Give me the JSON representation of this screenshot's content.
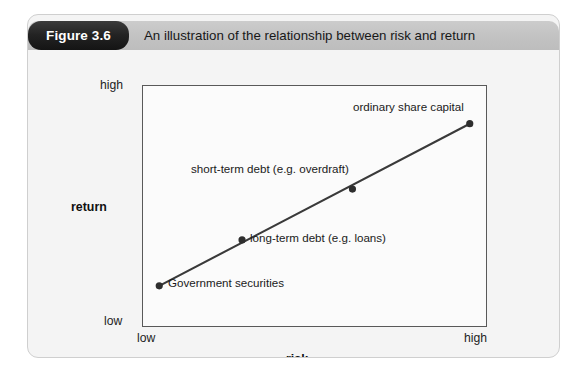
{
  "figure": {
    "badge_label": "Figure 3.6",
    "title": "An illustration of the relationship between risk and return"
  },
  "axes": {
    "y_title": "return",
    "x_title": "risk",
    "y_high": "high",
    "y_low": "low",
    "x_low": "low",
    "x_high": "high"
  },
  "colors": {
    "badge": "#232323",
    "header_band": "#c4c4c4",
    "card_background": "#f4f4f4",
    "plot_border": "#595959",
    "line": "#3a3a3a",
    "point": "#2e2e2e"
  },
  "chart_data": {
    "type": "scatter",
    "title": "An illustration of the relationship between risk and return",
    "xlabel": "risk",
    "ylabel": "return",
    "xlim": [
      0,
      1
    ],
    "ylim": [
      0,
      1
    ],
    "xtick_labels": [
      "low",
      "high"
    ],
    "ytick_labels": [
      "low",
      "high"
    ],
    "grid": false,
    "legend": "none",
    "line_through_points": true,
    "points": [
      {
        "label": "Government securities",
        "x": 0.05,
        "y": 0.17
      },
      {
        "label": "long-term debt (e.g. loans)",
        "x": 0.29,
        "y": 0.36
      },
      {
        "label": "short-term debt (e.g. overdraft)",
        "x": 0.61,
        "y": 0.57
      },
      {
        "label": "ordinary share capital",
        "x": 0.95,
        "y": 0.84
      }
    ]
  }
}
